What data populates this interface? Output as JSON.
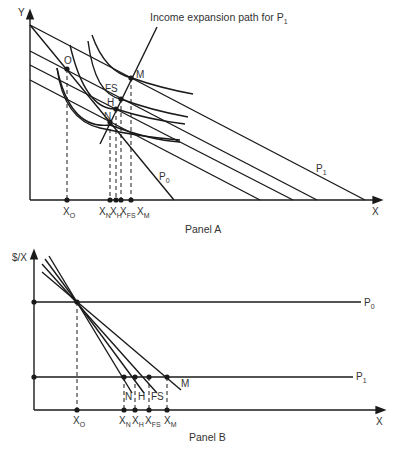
{
  "panel_a": {
    "caption": "Panel A",
    "y_label": "Y",
    "x_label": "X",
    "expansion_path_label": "Income expansion path for P",
    "expansion_path_sub": "1",
    "budget_labels": {
      "p0": "P",
      "p0_sub": "0",
      "p1": "P",
      "p1_sub": "1"
    },
    "points": {
      "O": "O",
      "M": "M",
      "FS": "FS",
      "H": "H",
      "N": "N"
    },
    "ticks": [
      {
        "main": "X",
        "sub": "O"
      },
      {
        "main": "X",
        "sub": "N"
      },
      {
        "main": "X",
        "sub": "H"
      },
      {
        "main": "X",
        "sub": "FS"
      },
      {
        "main": "X",
        "sub": "M"
      }
    ]
  },
  "panel_b": {
    "caption": "Panel B",
    "y_label": "$/X",
    "x_label": "X",
    "price_labels": {
      "p0": "P",
      "p0_sub": "0",
      "p1": "P",
      "p1_sub": "1"
    },
    "curve_labels": {
      "N": "N",
      "H": "H",
      "FS": "FS",
      "M": "M"
    },
    "ticks": [
      {
        "main": "X",
        "sub": "O"
      },
      {
        "main": "X",
        "sub": "N"
      },
      {
        "main": "X",
        "sub": "H"
      },
      {
        "main": "X",
        "sub": "FS"
      },
      {
        "main": "X",
        "sub": "M"
      }
    ]
  },
  "colors": {
    "ink": "#1a1a1a",
    "text": "#333333"
  }
}
